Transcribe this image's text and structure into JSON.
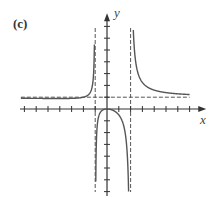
{
  "panel": {
    "label": "(c)"
  },
  "axes": {
    "x_label": "x",
    "y_label": "y"
  },
  "chart_data": {
    "type": "line",
    "title": "(c)",
    "xlabel": "x",
    "ylabel": "y",
    "xlim": [
      -7,
      7
    ],
    "ylim": [
      -7,
      7
    ],
    "grid": false,
    "tick_spacing": 1,
    "asymptotes": {
      "vertical": [
        -1,
        2
      ],
      "horizontal": [
        1
      ]
    },
    "function_hint": "y = x^2 / ((x + 1)(x - 2))",
    "key_points": [
      {
        "x": 0,
        "y": 0,
        "note": "local maximum"
      }
    ],
    "branches": [
      {
        "name": "left",
        "domain": [
          -7,
          -1
        ],
        "behavior": "approaches y=1 from above as x→-∞, rises to +∞ as x→-1⁻"
      },
      {
        "name": "middle",
        "domain": [
          -1,
          2
        ],
        "behavior": "from -∞ at x=-1⁺, peaks at (0,0), falls to -∞ as x→2⁻"
      },
      {
        "name": "right",
        "domain": [
          2,
          7
        ],
        "behavior": "from +∞ at x=2⁺, decreases toward y=1"
      }
    ]
  },
  "colors": {
    "curve": "#555555",
    "axis": "#333333",
    "asymptote": "#555555"
  }
}
